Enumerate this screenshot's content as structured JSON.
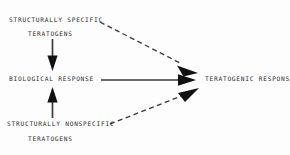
{
  "diagram": {
    "background_color": "#fdfdfd",
    "ink_color": "#2b2b2b",
    "nodes": {
      "structurally_specific": "STRUCTURALLY SPECIFIC",
      "teratogens_top": "TERATOGENS",
      "biological_response": "BIOLOGICAL RESPONSE",
      "teratogenic_response": "TERATOGENIC RESPONSE",
      "structurally_nonspecific": "STRUCTURALLY NONSPECIFIC",
      "teratogens_bottom": "TERATOGENS"
    },
    "edges": [
      {
        "id": "specific-to-biological",
        "from": "teratogens_top",
        "to": "biological_response",
        "style": "solid",
        "direction": "down"
      },
      {
        "id": "nonspecific-to-biological",
        "from": "teratogens_bottom",
        "to": "biological_response",
        "style": "solid",
        "direction": "up"
      },
      {
        "id": "biological-to-teratogenic",
        "from": "biological_response",
        "to": "teratogenic_response",
        "style": "solid",
        "direction": "right"
      },
      {
        "id": "specific-to-teratogenic",
        "from": "structurally_specific",
        "to": "teratogenic_response",
        "style": "dashed",
        "direction": "down-right"
      },
      {
        "id": "nonspecific-to-teratogenic",
        "from": "structurally_nonspecific",
        "to": "teratogenic_response",
        "style": "dashed",
        "direction": "up-right"
      }
    ]
  }
}
